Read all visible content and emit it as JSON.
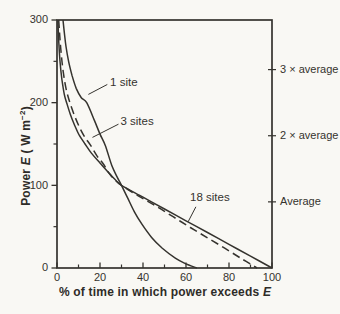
{
  "figure": {
    "background": "#f9f8f4",
    "ink_color": "#35332e",
    "y_axis_title": {
      "word": "Power ",
      "symbol": "E",
      "unit_open": " ( W m",
      "unit_exp": "−2",
      "unit_close": ")"
    },
    "x_axis_title": {
      "text": "% of time in which power exceeds ",
      "symbol": "E"
    }
  },
  "chart_data": {
    "type": "line",
    "title": "",
    "xlabel": "% of time in which power exceeds E",
    "ylabel": "Power E (W m⁻²)",
    "xlim": [
      0,
      100
    ],
    "ylim": [
      0,
      300
    ],
    "grid": false,
    "x_major_ticks": [
      0,
      20,
      40,
      60,
      80,
      100
    ],
    "x_minor_ticks": [
      10,
      30,
      50,
      70,
      90
    ],
    "y_major_ticks": [
      0,
      100,
      200,
      300
    ],
    "y_minor_ticks": [
      50,
      150,
      250
    ],
    "right_axis_ticks": [
      {
        "label": "3 × average",
        "value": 240
      },
      {
        "label": "2 × average",
        "value": 160
      },
      {
        "label": "Average",
        "value": 80
      }
    ],
    "series": [
      {
        "name": "1 site",
        "style": "solid",
        "points": [
          [
            2.8,
            300
          ],
          [
            3.4,
            285
          ],
          [
            4.2,
            268
          ],
          [
            5.4,
            250
          ],
          [
            7,
            233
          ],
          [
            9,
            217
          ],
          [
            11.3,
            206
          ],
          [
            13.8,
            200
          ],
          [
            17.5,
            178
          ],
          [
            20,
            162
          ],
          [
            22.5,
            148
          ],
          [
            25.5,
            124
          ],
          [
            28,
            110
          ],
          [
            30,
            100
          ],
          [
            33,
            84
          ],
          [
            36,
            68
          ],
          [
            39.5,
            53
          ],
          [
            44,
            37
          ],
          [
            49,
            24
          ],
          [
            55,
            12
          ],
          [
            60,
            5
          ],
          [
            65,
            0
          ]
        ]
      },
      {
        "name": "3 sites",
        "style": "dashed",
        "points": [
          [
            0.8,
            300
          ],
          [
            1.3,
            280
          ],
          [
            2,
            258
          ],
          [
            3,
            235
          ],
          [
            4.3,
            216
          ],
          [
            6,
            200
          ],
          [
            8.2,
            184
          ],
          [
            10.5,
            170
          ],
          [
            13,
            158
          ],
          [
            15.5,
            149
          ],
          [
            18.5,
            136
          ],
          [
            21.5,
            126
          ],
          [
            25,
            112
          ],
          [
            30,
            100
          ],
          [
            38,
            87
          ],
          [
            46,
            75
          ],
          [
            54,
            62
          ],
          [
            62,
            49
          ],
          [
            70,
            36.5
          ],
          [
            78,
            24
          ],
          [
            86,
            11
          ],
          [
            93,
            0
          ]
        ]
      },
      {
        "name": "18 sites",
        "style": "solid",
        "points": [
          [
            0.4,
            300
          ],
          [
            0.8,
            275
          ],
          [
            1.4,
            250
          ],
          [
            2.3,
            228
          ],
          [
            3.4,
            210
          ],
          [
            4.6,
            199
          ],
          [
            6.2,
            186
          ],
          [
            8,
            174
          ],
          [
            10.3,
            161
          ],
          [
            12.8,
            151
          ],
          [
            16,
            139
          ],
          [
            20,
            127
          ],
          [
            24.5,
            114
          ],
          [
            27,
            107
          ],
          [
            30,
            100
          ],
          [
            40,
            85.7
          ],
          [
            50,
            71.4
          ],
          [
            60,
            57.1
          ],
          [
            70,
            42.9
          ],
          [
            80,
            28.6
          ],
          [
            90,
            14.3
          ],
          [
            100,
            0
          ]
        ]
      }
    ],
    "annotations": [
      {
        "text": "1 site",
        "x": 24.7,
        "y": 224,
        "leader": [
          [
            23.4,
            222
          ],
          [
            14.6,
            210
          ]
        ]
      },
      {
        "text": "3 sites",
        "x": 29.5,
        "y": 177,
        "leader": [
          [
            28.6,
            174
          ],
          [
            16.5,
            158
          ]
        ]
      },
      {
        "text": "18 sites",
        "x": 61.9,
        "y": 85,
        "leader": [
          [
            64.6,
            74
          ],
          [
            61.0,
            56
          ]
        ]
      }
    ]
  }
}
